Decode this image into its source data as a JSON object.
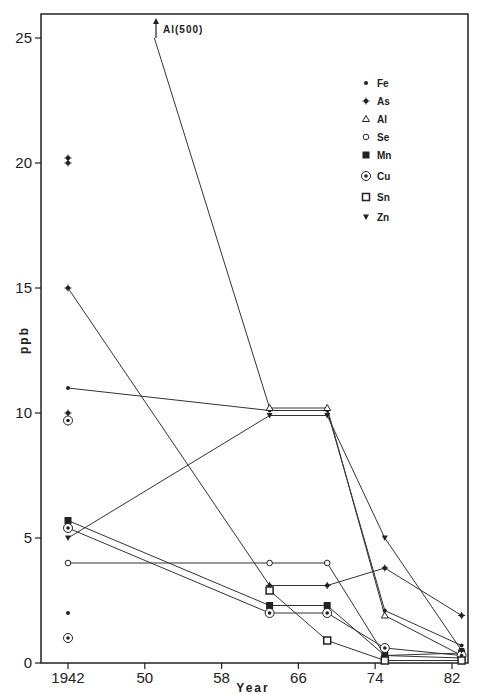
{
  "chart_data": {
    "type": "line",
    "title": "",
    "xlabel": "Year",
    "ylabel": "ppb",
    "xlim": [
      1940,
      1986
    ],
    "ylim": [
      0,
      26
    ],
    "grid": false,
    "legend_position": "upper right",
    "x_ticks": [
      1942,
      1950,
      1958,
      1966,
      1974,
      1982
    ],
    "x_tick_labels": [
      "1942",
      "50",
      "58",
      "66",
      "74",
      "82"
    ],
    "y_ticks": [
      0,
      5,
      10,
      15,
      20,
      25
    ],
    "y_tick_labels": [
      "0",
      "5",
      "10",
      "15",
      "20",
      "25"
    ],
    "annotations": [
      {
        "text": "Al(500)",
        "x": 1951,
        "y": 25.5,
        "arrow": "up"
      }
    ],
    "series": [
      {
        "name": "Fe",
        "marker": "dot",
        "x": [
          1942,
          1963,
          1969,
          1975,
          1983
        ],
        "values": [
          11.0,
          10.1,
          10.1,
          2.1,
          0.7
        ],
        "extra_points": [
          {
            "x": 1942,
            "y": 2.0
          }
        ]
      },
      {
        "name": "As",
        "marker": "asterisk",
        "x": [
          1942,
          1963,
          1969,
          1975,
          1983
        ],
        "values": [
          15.0,
          3.1,
          3.1,
          3.8,
          1.9
        ],
        "extra_points": [
          {
            "x": 1942,
            "y": 20.2
          },
          {
            "x": 1942,
            "y": 20.0
          },
          {
            "x": 1942,
            "y": 10.0
          }
        ]
      },
      {
        "name": "Al",
        "marker": "triangle-open",
        "x": [
          1951,
          1963,
          1969,
          1975,
          1983
        ],
        "values": [
          25.0,
          10.2,
          10.2,
          1.9,
          0.3
        ],
        "note": "1942 value 500 off-scale"
      },
      {
        "name": "Se",
        "marker": "circle-open",
        "x": [
          1942,
          1963,
          1969,
          1975,
          1983
        ],
        "values": [
          4.0,
          4.0,
          4.0,
          0.3,
          0.2
        ]
      },
      {
        "name": "Mn",
        "marker": "square-filled",
        "x": [
          1942,
          1963,
          1969,
          1975,
          1983
        ],
        "values": [
          5.7,
          2.3,
          2.3,
          0.3,
          0.4
        ]
      },
      {
        "name": "Cu",
        "marker": "circle-dot",
        "x": [
          1942,
          1963,
          1969,
          1975,
          1983
        ],
        "values": [
          5.4,
          2.0,
          2.0,
          0.6,
          0.3
        ],
        "extra_points": [
          {
            "x": 1942,
            "y": 9.7
          },
          {
            "x": 1942,
            "y": 1.0
          }
        ]
      },
      {
        "name": "Sn",
        "marker": "square-open",
        "x": [
          1963,
          1969,
          1975,
          1983
        ],
        "values": [
          2.9,
          0.9,
          0.1,
          0.1
        ]
      },
      {
        "name": "Zn",
        "marker": "triangle-down",
        "x": [
          1942,
          1963,
          1969,
          1975,
          1983
        ],
        "values": [
          5.0,
          9.9,
          9.9,
          5.0,
          0.5
        ]
      }
    ],
    "legend": [
      "Fe",
      "As",
      "Al",
      "Se",
      "Mn",
      "Cu",
      "Sn",
      "Zn"
    ]
  },
  "labels": {
    "xlabel": "Year",
    "ylabel": "ppb",
    "annotation": "Al(500)"
  }
}
